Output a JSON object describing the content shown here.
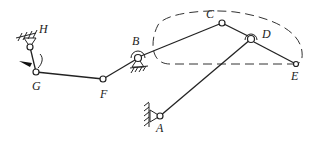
{
  "diagram": {
    "type": "planar linkage mechanism",
    "labels": {
      "H": "H",
      "G": "G",
      "F": "F",
      "B": "B",
      "C": "C",
      "D": "D",
      "E": "E",
      "A": "A"
    },
    "joints": {
      "H": {
        "x": 30,
        "y": 47,
        "fixed": true
      },
      "G": {
        "x": 36,
        "y": 72
      },
      "F": {
        "x": 103,
        "y": 79
      },
      "B": {
        "x": 138,
        "y": 58,
        "fixed": true
      },
      "C": {
        "x": 222,
        "y": 23
      },
      "D": {
        "x": 251,
        "y": 39
      },
      "E": {
        "x": 296,
        "y": 64
      },
      "A": {
        "x": 160,
        "y": 116,
        "fixed": true
      }
    },
    "links": [
      [
        "H",
        "G"
      ],
      [
        "G",
        "F"
      ],
      [
        "F",
        "B"
      ],
      [
        "B",
        "C"
      ],
      [
        "C",
        "D"
      ],
      [
        "D",
        "E"
      ],
      [
        "A",
        "D"
      ]
    ],
    "coupler_curve": "dashed closed curve traced by point E",
    "stroke_color": "#222222"
  }
}
